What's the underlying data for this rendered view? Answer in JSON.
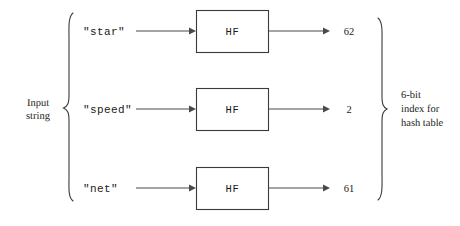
{
  "diagram": {
    "left_group_label_line1": "Input",
    "left_group_label_line2": "string",
    "right_group_label_line1": "6-bit",
    "right_group_label_line2": "index for",
    "right_group_label_line3": "hash table",
    "colors": {
      "background": "#ffffff",
      "stroke": "#3a3a3a",
      "line": "#4a4a4a",
      "text": "#1a1a1a"
    },
    "rows": [
      {
        "input": "\"star\"",
        "function": "HF",
        "output": "62"
      },
      {
        "input": "\"speed\"",
        "function": "HF",
        "output": "2"
      },
      {
        "input": "\"net\"",
        "function": "HF",
        "output": "61"
      }
    ]
  }
}
